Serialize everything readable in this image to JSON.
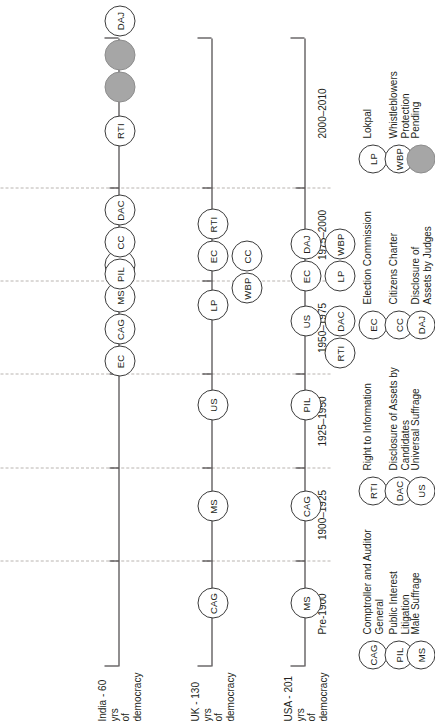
{
  "figure": {
    "type": "timeline-comparison",
    "orientation": "rotated-90-ccw"
  },
  "periods": [
    {
      "id": "p1",
      "label": "Pre-1900"
    },
    {
      "id": "p2",
      "label": "1900–1925"
    },
    {
      "id": "p3",
      "label": "1925–1950"
    },
    {
      "id": "p4",
      "label": "1950–1975"
    },
    {
      "id": "p5",
      "label": "1975–2000"
    },
    {
      "id": "p6",
      "label": "2000–2010"
    }
  ],
  "countries": [
    {
      "id": "india",
      "line1": "India - 60 yrs",
      "line2": "of democracy"
    },
    {
      "id": "uk",
      "line1": "UK - 130 yrs",
      "line2": "of democracy"
    },
    {
      "id": "usa",
      "line1": "USA - 201 yrs",
      "line2": "of democracy"
    }
  ],
  "nodes": {
    "india": [
      {
        "code": "EC",
        "pending": false
      },
      {
        "code": "CAG",
        "pending": false
      },
      {
        "code": "MS",
        "pending": false
      },
      {
        "code": "US",
        "pending": false
      },
      {
        "code": "PIL",
        "pending": false
      },
      {
        "code": "CC",
        "pending": false
      },
      {
        "code": "DAC",
        "pending": false
      },
      {
        "code": "RTI",
        "pending": false
      },
      {
        "code": "WBP",
        "pending": true
      },
      {
        "code": "LP",
        "pending": true
      },
      {
        "code": "DAJ",
        "pending": false
      }
    ],
    "uk": [
      {
        "code": "CAG",
        "pending": false
      },
      {
        "code": "MS",
        "pending": false
      },
      {
        "code": "US",
        "pending": false
      },
      {
        "code": "LP",
        "pending": false
      },
      {
        "code": "CC",
        "pending": false
      },
      {
        "code": "WBP",
        "pending": false
      },
      {
        "code": "RTI",
        "pending": false
      },
      {
        "code": "EC",
        "pending": false
      }
    ],
    "usa": [
      {
        "code": "MS",
        "pending": false
      },
      {
        "code": "CAG",
        "pending": false
      },
      {
        "code": "PIL",
        "pending": false
      },
      {
        "code": "RTI",
        "pending": false
      },
      {
        "code": "DAC",
        "pending": false
      },
      {
        "code": "US",
        "pending": false
      },
      {
        "code": "LP",
        "pending": false
      },
      {
        "code": "EC",
        "pending": false
      },
      {
        "code": "WBP",
        "pending": false
      },
      {
        "code": "DAJ",
        "pending": false
      }
    ]
  },
  "legend": [
    {
      "code": "CAG",
      "pending": false,
      "text": "Comptroller and Auditor\nGeneral"
    },
    {
      "code": "PIL",
      "pending": false,
      "text": "Public Interest\nLitigation"
    },
    {
      "code": "MS",
      "pending": false,
      "text": "Male Suffrage"
    },
    {
      "code": "RTI",
      "pending": false,
      "text": "Right to Information"
    },
    {
      "code": "DAC",
      "pending": false,
      "text": "Disclosure of Assets by\nCandidates"
    },
    {
      "code": "US",
      "pending": false,
      "text": "Universal Suffrage"
    },
    {
      "code": "EC",
      "pending": false,
      "text": "Election Commission"
    },
    {
      "code": "CC",
      "pending": false,
      "text": "Citizens Charter"
    },
    {
      "code": "DAJ",
      "pending": false,
      "text": "Disclosure of\nAssets by Judges"
    },
    {
      "code": "LP",
      "pending": false,
      "text": "Lokpal"
    },
    {
      "code": "WBP",
      "pending": false,
      "text": "Whistleblowers\nProtection"
    },
    {
      "code": "",
      "pending": true,
      "text": "Pending"
    }
  ],
  "colors": {
    "ink": "#231f20",
    "pending_fill": "#a6a6a6",
    "grid": "#b9b4b0"
  }
}
